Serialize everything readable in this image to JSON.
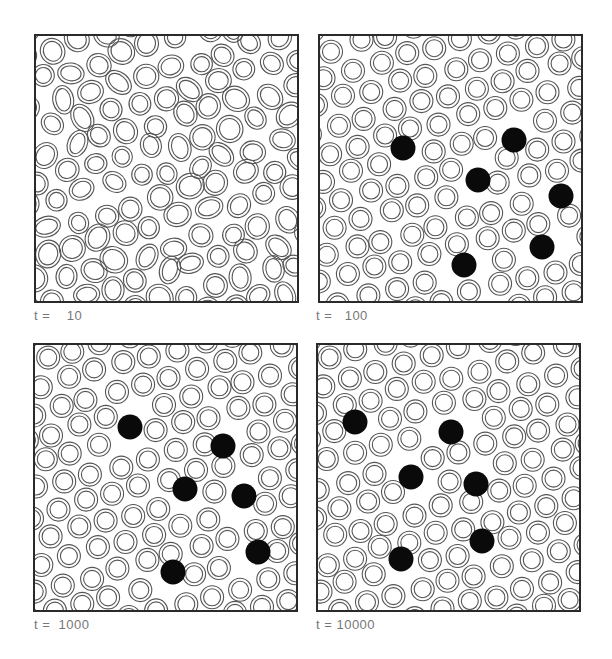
{
  "figure": {
    "panels": [
      {
        "id": "t10",
        "label": "t =    10",
        "time": 10,
        "box": {
          "x": 34,
          "y": 34,
          "w": 265,
          "h": 269
        },
        "label_pos": {
          "x": 34,
          "y": 308
        },
        "ordered": false,
        "black_particles": []
      },
      {
        "id": "t100",
        "label": "t =   100",
        "time": 100,
        "box": {
          "x": 318,
          "y": 34,
          "w": 265,
          "h": 269
        },
        "label_pos": {
          "x": 316,
          "y": 308
        },
        "ordered": true,
        "black_particles": [
          [
            83,
            112
          ],
          [
            194,
            104
          ],
          [
            158,
            144
          ],
          [
            241,
            160
          ],
          [
            222,
            211
          ],
          [
            144,
            229
          ]
        ]
      },
      {
        "id": "t1000",
        "label": "t =  1000",
        "time": 1000,
        "box": {
          "x": 33,
          "y": 343,
          "w": 265,
          "h": 269
        },
        "label_pos": {
          "x": 34,
          "y": 617
        },
        "ordered": true,
        "black_particles": [
          [
            95,
            82
          ],
          [
            188,
            101
          ],
          [
            150,
            144
          ],
          [
            209,
            151
          ],
          [
            223,
            207
          ],
          [
            138,
            227
          ]
        ]
      },
      {
        "id": "t10000",
        "label": "t = 10000",
        "time": 10000,
        "box": {
          "x": 316,
          "y": 343,
          "w": 265,
          "h": 269
        },
        "label_pos": {
          "x": 316,
          "y": 617
        },
        "ordered": true,
        "black_particles": [
          [
            37,
            77
          ],
          [
            133,
            87
          ],
          [
            93,
            132
          ],
          [
            158,
            139
          ],
          [
            164,
            196
          ],
          [
            83,
            214
          ]
        ]
      }
    ],
    "style": {
      "ring_color": "#555555",
      "particle_color": "#0a0a0a",
      "border_color": "#2a2a2a",
      "label_color": "#777777",
      "ring_outer_r": 11.5,
      "ring_inner_r": 8.5,
      "particle_r": 12.5,
      "lattice_spacing": 28.5
    }
  }
}
